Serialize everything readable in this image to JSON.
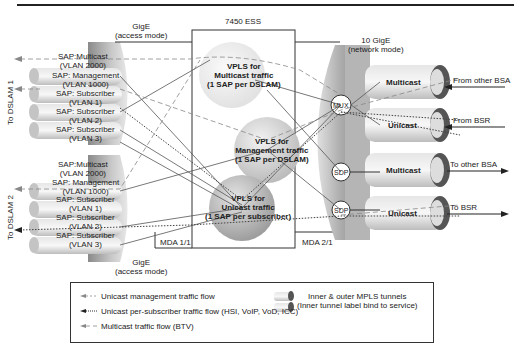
{
  "diagram": {
    "ess_label": "7450 ESS",
    "left_port": {
      "label_top": "GigE\n(access mode)",
      "line1": "GigE",
      "line2": "(access mode)"
    },
    "left_port_bottom": {
      "line1": "GigE",
      "line2": "(access mode)"
    },
    "right_port": {
      "line1": "10 GigE",
      "line2": "(network mode)"
    },
    "mda_left": "MDA 1/1",
    "mda_right": "MDA 2/1",
    "dslam1": {
      "label": "To DSLAM 1",
      "saps": [
        {
          "line1": "SAP:Multicast",
          "line2": "(VLAN 2000)"
        },
        {
          "line1": "SAP: Management",
          "line2": "(VLAN 1000)"
        },
        {
          "line1": "SAP: Subscriber",
          "line2": "(VLAN 1)"
        },
        {
          "line1": "SAP: Subscriber",
          "line2": "(VLAN 2)"
        },
        {
          "line1": "SAP: Subscriber",
          "line2": "(VLAN 3)"
        }
      ]
    },
    "dslam2": {
      "label": "To DSLAM 2",
      "saps": [
        {
          "line1": "SAP:Multicast",
          "line2": "(VLAN 2000)"
        },
        {
          "line1": "SAP: Management",
          "line2": "(VLAN 1000)"
        },
        {
          "line1": "SAP: Subscriber",
          "line2": "(VLAN 1)"
        },
        {
          "line1": "SAP: Subscriber",
          "line2": "(VLAN 2)"
        },
        {
          "line1": "SAP: Subscriber",
          "line2": "(VLAN 3)"
        }
      ]
    },
    "vpls": [
      {
        "line1": "VPLS for",
        "line2": "Multicast traffic",
        "line3": "(1 SAP per DSLAM)"
      },
      {
        "line1": "VPLS for",
        "line2": "Management traffic",
        "line3": "(1 SAP per DSLAM)"
      },
      {
        "line1": "VPLS for",
        "line2": "Unicast traffic",
        "line3": "(1 SAP per subscriber)"
      }
    ],
    "nodes": {
      "mux": "MUX",
      "sdp1": "SDP",
      "sdp2": "SDP"
    },
    "tunnels": [
      {
        "label": "Multicast",
        "flow": "From other BSA"
      },
      {
        "label": "Unicast",
        "flow": "From BSR"
      },
      {
        "label": "Multicast",
        "flow": "To other BSA"
      },
      {
        "label": "Unicast",
        "flow": "To BSR"
      }
    ]
  },
  "legend": {
    "items": [
      {
        "icon": "dashed-arrow-icon",
        "label": "Unicast management traffic flow"
      },
      {
        "icon": "dotted-arrow-icon",
        "label": "Unicast per-subscriber traffic flow (HSI, VoIP, VoD, ICC)"
      },
      {
        "icon": "long-dash-arrow-icon",
        "label": "Multicast traffic flow (BTV)"
      }
    ],
    "tunnel_line1": "Inner & outer MPLS tunnels",
    "tunnel_line2": "(Inner tunnel label bind to service)"
  }
}
